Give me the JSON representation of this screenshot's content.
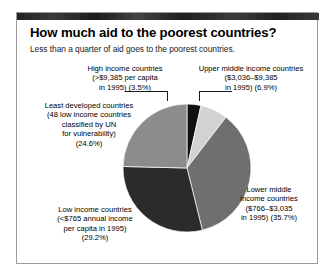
{
  "credit": "The Reality of Aid 2000, Earthscan",
  "panel": {
    "title": "How much aid to the poorest countries?",
    "subtitle": "Less than a quarter of aid goes to the poorest countries."
  },
  "labels": {
    "high": "High income countries\n(>$9,385 per capita\nin 1995) (3.5%)",
    "upper_middle": "Upper middle income countries\n($3,036–$9,385\nin 1995) (6.9%)",
    "least_developed": "Least developed countries\n(48 low income countries\nclassified by UN\nfor vulnerability)\n(24.6%)",
    "low": "Low income countries\n(<$765 annual income\nper capita in 1995)\n(29.2%)",
    "lower_middle": "Lower middle\nincome countries\n($766–$3,035\nin 1995) (35.7%)"
  },
  "chart_data": {
    "type": "pie",
    "title": "How much aid to the poorest countries?",
    "subtitle": "Less than a quarter of aid goes to the poorest countries.",
    "unit": "percent",
    "legend": "labels-with-leader-lines",
    "start_angle_deg": 0,
    "direction": "clockwise",
    "categories": [
      "High income countries (>$9,385 per capita in 1995)",
      "Upper middle income countries ($3,036–$9,385 in 1995)",
      "Lower middle income countries ($766–$3,035 in 1995)",
      "Low income countries (<$765 annual income per capita in 1995)",
      "Least developed countries (48 low income countries classified by UN for vulnerability)"
    ],
    "values": [
      3.5,
      6.9,
      35.7,
      29.2,
      24.6
    ],
    "colors": [
      "#111111",
      "#d2d2d2",
      "#6f6f6f",
      "#2b2b2b",
      "#8c8c8c"
    ],
    "slices": [
      {
        "name": "High income countries",
        "value": 3.5,
        "color": "#111111",
        "label_key": "high"
      },
      {
        "name": "Upper middle income countries",
        "value": 6.9,
        "color": "#d2d2d2",
        "label_key": "upper_middle"
      },
      {
        "name": "Lower middle income countries",
        "value": 35.7,
        "color": "#6f6f6f",
        "label_key": "lower_middle"
      },
      {
        "name": "Low income countries",
        "value": 29.2,
        "color": "#2b2b2b",
        "label_key": "low"
      },
      {
        "name": "Least developed countries",
        "value": 24.6,
        "color": "#8c8c8c",
        "label_key": "least_developed"
      }
    ]
  }
}
